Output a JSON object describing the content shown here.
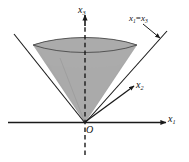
{
  "figure": {
    "type": "3d-cone-diagram",
    "background_color": "#ffffff",
    "fill_color": "#a8a8a8",
    "line_color": "#1a1a1a",
    "axes": {
      "x1": {
        "label": "x",
        "subscript": "1",
        "direction": "right",
        "style": "solid",
        "arrow": true
      },
      "x2": {
        "label": "x",
        "subscript": "2",
        "direction": "up-right",
        "style": "solid",
        "arrow": true
      },
      "x3": {
        "label": "x",
        "subscript": "3",
        "direction": "up",
        "style": "dashed",
        "arrow": true
      }
    },
    "origin_label": "O",
    "annotation": {
      "lhs": "x",
      "lhs_sub": "1",
      "operator": "=",
      "rhs": "x",
      "rhs_sub": "3",
      "full_text": "x1=x3",
      "leader_arrow": true
    }
  }
}
